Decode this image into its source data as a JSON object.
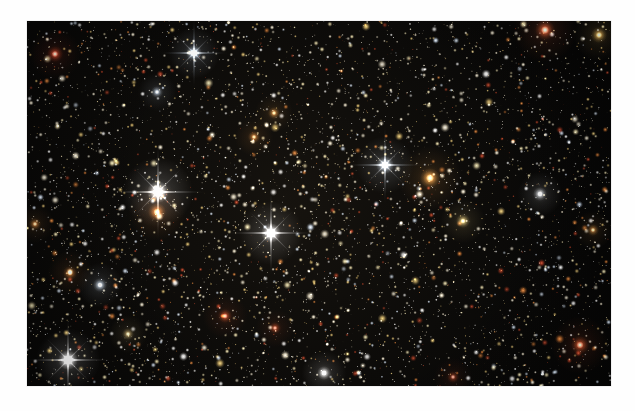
{
  "page": {
    "background_color": "#fefefe",
    "width": 635,
    "height": 411
  },
  "photo": {
    "name": "globular-star-cluster-field",
    "alt_text": "Dense field of thousands of stars in a globular cluster",
    "x": 27,
    "y": 21,
    "width": 584,
    "height": 365,
    "background_color": "#000000",
    "caption": ""
  },
  "chart_data": {
    "type": "scatter",
    "title": "",
    "xlabel": "",
    "ylabel": "",
    "xlim": [
      0,
      584
    ],
    "ylim": [
      0,
      365
    ],
    "grid": false,
    "legend": "none",
    "palette": {
      "sky": "#050505",
      "blue_white": "#cfe0f5",
      "white": "#ffffff",
      "cream": "#f4ead0",
      "pale_yellow": "#e8d9a8",
      "gold": "#d8b86a",
      "orange": "#d2762f",
      "red": "#b0361c",
      "deep_red": "#7a2414"
    },
    "background_star_count": 6200,
    "notable_stars": [
      {
        "label": "bright-white-spike-star-left",
        "x": 131,
        "y": 171,
        "radius": 11,
        "color": "#ffffff",
        "spikes": true,
        "brightness": 1.0
      },
      {
        "label": "orange-giant-below-left",
        "x": 130,
        "y": 191,
        "radius": 9,
        "color": "#c9702e",
        "spikes": false,
        "brightness": 0.85
      },
      {
        "label": "bright-white-spike-star-center",
        "x": 244,
        "y": 212,
        "radius": 10,
        "color": "#fbfbff",
        "spikes": true,
        "brightness": 0.95
      },
      {
        "label": "bright-white-spike-star-lower-left",
        "x": 41,
        "y": 339,
        "radius": 10,
        "color": "#ffffff",
        "spikes": true,
        "brightness": 0.95
      },
      {
        "label": "blue-white-star-upper-left",
        "x": 167,
        "y": 32,
        "radius": 8,
        "color": "#cfe0f5",
        "spikes": true,
        "brightness": 0.85
      },
      {
        "label": "red-giant-top-left",
        "x": 28,
        "y": 33,
        "radius": 8,
        "color": "#b0361c",
        "spikes": false,
        "brightness": 0.8
      },
      {
        "label": "blue-white-star-mid-right",
        "x": 358,
        "y": 144,
        "radius": 9,
        "color": "#dce9f8",
        "spikes": true,
        "brightness": 0.85
      },
      {
        "label": "orange-giant-mid-right",
        "x": 403,
        "y": 157,
        "radius": 10,
        "color": "#d08a3c",
        "spikes": false,
        "brightness": 0.85
      },
      {
        "label": "red-giant-top-right",
        "x": 518,
        "y": 9,
        "radius": 10,
        "color": "#c4512a",
        "spikes": false,
        "brightness": 0.85
      },
      {
        "label": "gold-star-top-right-corner",
        "x": 572,
        "y": 14,
        "radius": 8,
        "color": "#d8a84e",
        "spikes": false,
        "brightness": 0.75
      },
      {
        "label": "red-giant-lower-right",
        "x": 553,
        "y": 324,
        "radius": 9,
        "color": "#bf4a22",
        "spikes": false,
        "brightness": 0.8
      },
      {
        "label": "blue-white-star-lower-left-2",
        "x": 73,
        "y": 264,
        "radius": 7,
        "color": "#d4e4f6",
        "spikes": false,
        "brightness": 0.7
      },
      {
        "label": "orange-star-lower-left",
        "x": 43,
        "y": 252,
        "radius": 7,
        "color": "#c2732f",
        "spikes": false,
        "brightness": 0.7
      },
      {
        "label": "red-star-mid-lower-center",
        "x": 198,
        "y": 295,
        "radius": 7,
        "color": "#b8421f",
        "spikes": false,
        "brightness": 0.7
      },
      {
        "label": "orange-star-upper-center",
        "x": 227,
        "y": 116,
        "radius": 6,
        "color": "#cf7f33",
        "spikes": false,
        "brightness": 0.65
      },
      {
        "label": "orange-star-upper-center-2",
        "x": 247,
        "y": 92,
        "radius": 6,
        "color": "#d08a3c",
        "spikes": false,
        "brightness": 0.65
      },
      {
        "label": "gold-star-center-right",
        "x": 436,
        "y": 200,
        "radius": 7,
        "color": "#ddc378",
        "spikes": false,
        "brightness": 0.7
      },
      {
        "label": "white-star-bottom-center",
        "x": 297,
        "y": 352,
        "radius": 7,
        "color": "#fdfdfd",
        "spikes": false,
        "brightness": 0.75
      },
      {
        "label": "blue-white-star-upper-left-2",
        "x": 130,
        "y": 71,
        "radius": 6,
        "color": "#cfe0f5",
        "spikes": false,
        "brightness": 0.6
      },
      {
        "label": "orange-star-left-edge",
        "x": 8,
        "y": 203,
        "radius": 6,
        "color": "#c87c34",
        "spikes": false,
        "brightness": 0.65
      },
      {
        "label": "orange-star-right-edge",
        "x": 566,
        "y": 209,
        "radius": 6,
        "color": "#cf8a3c",
        "spikes": false,
        "brightness": 0.65
      },
      {
        "label": "red-star-bottom-center-2",
        "x": 248,
        "y": 307,
        "radius": 6,
        "color": "#b8421f",
        "spikes": false,
        "brightness": 0.6
      },
      {
        "label": "gold-star-bottom-left",
        "x": 101,
        "y": 313,
        "radius": 6,
        "color": "#dfc17a",
        "spikes": false,
        "brightness": 0.6
      },
      {
        "label": "white-star-right-mid",
        "x": 513,
        "y": 173,
        "radius": 7,
        "color": "#f2f6fb",
        "spikes": false,
        "brightness": 0.7
      },
      {
        "label": "deep-red-star-bottom-right",
        "x": 426,
        "y": 356,
        "radius": 6,
        "color": "#a23a1c",
        "spikes": false,
        "brightness": 0.6
      }
    ]
  }
}
